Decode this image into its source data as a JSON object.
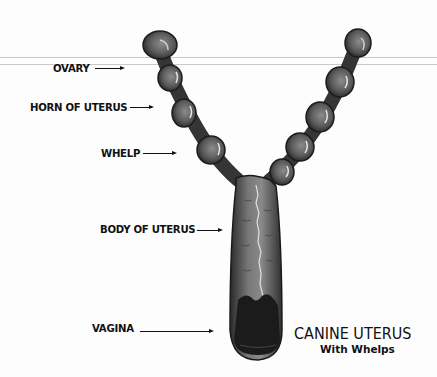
{
  "diagram": {
    "title": "CANINE UTERUS",
    "subtitle": "With Whelps",
    "labels": [
      {
        "id": "ovary",
        "text": "OVARY"
      },
      {
        "id": "horn",
        "text": "HORN OF UTERUS"
      },
      {
        "id": "whelp",
        "text": "WHELP"
      },
      {
        "id": "body",
        "text": "BODY OF UTERUS"
      },
      {
        "id": "vagina",
        "text": "VAGINA"
      }
    ],
    "colors": {
      "background": "#fdfdfd",
      "tissue_dark": "#2e2e2e",
      "tissue_mid": "#6a6a6a",
      "tissue_light": "#9a9a9a",
      "text": "#111111"
    }
  }
}
